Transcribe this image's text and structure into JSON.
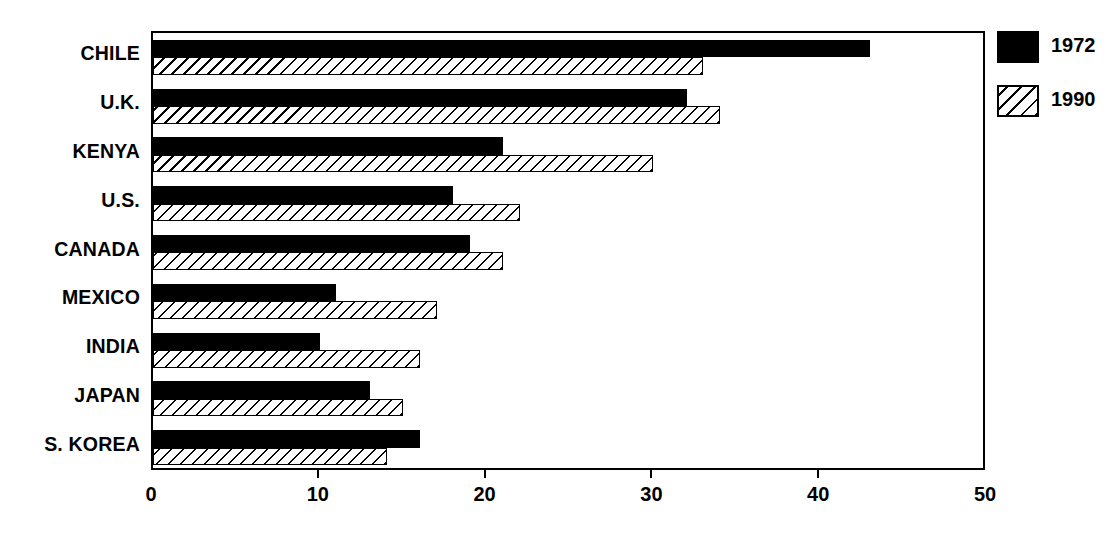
{
  "chart_data": {
    "type": "bar",
    "orientation": "horizontal",
    "title": "",
    "xlabel": "",
    "ylabel": "",
    "xlim": [
      0,
      50
    ],
    "xticks": [
      0,
      10,
      20,
      30,
      40,
      50
    ],
    "xtick_labels": [
      "0",
      "10",
      "20",
      "30",
      "40",
      "50"
    ],
    "grid": false,
    "legend_position": "right",
    "categories": [
      "CHILE",
      "U.K.",
      "KENYA",
      "U.S.",
      "CANADA",
      "MEXICO",
      "INDIA",
      "JAPAN",
      "S. KOREA"
    ],
    "series": [
      {
        "name": "1972",
        "style": "solid-black",
        "values": [
          43,
          32,
          21,
          18,
          19,
          11,
          10,
          13,
          16
        ]
      },
      {
        "name": "1990",
        "style": "diagonal-hatch",
        "values": [
          33,
          34,
          30,
          22,
          21,
          17,
          16,
          15,
          14
        ]
      }
    ]
  },
  "legend": {
    "entries": [
      {
        "label": "1972",
        "swatch": "solid-black-swatch"
      },
      {
        "label": "1990",
        "swatch": "hatched-swatch"
      }
    ]
  }
}
